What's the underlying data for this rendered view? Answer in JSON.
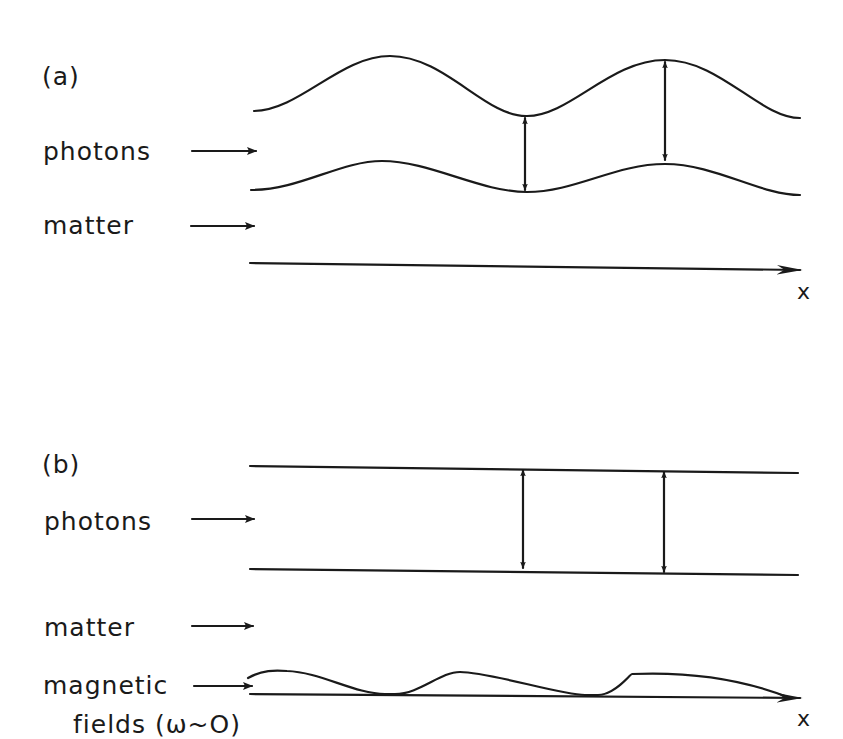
{
  "panel_a": {
    "tag": "(a)",
    "labels": {
      "photons": "photons",
      "matter": "matter"
    },
    "axis_label": "x"
  },
  "panel_b": {
    "tag": "(b)",
    "labels": {
      "photons": "photons",
      "matter": "matter",
      "magnetic_1": "magnetic",
      "magnetic_2": "fields (ω~O)"
    },
    "axis_label": "x"
  },
  "colors": {
    "ink": "#1a1a1a",
    "background": "#ffffff"
  }
}
